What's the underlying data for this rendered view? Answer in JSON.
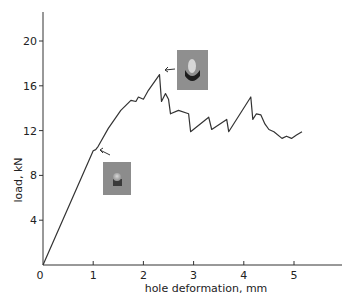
{
  "chart_data": {
    "type": "line",
    "title": "",
    "xlabel": "hole deformation, mm",
    "ylabel": "load, kN",
    "xlim": [
      0,
      5.5
    ],
    "ylim": [
      0,
      22
    ],
    "x_ticks": [
      "0",
      "1",
      "2",
      "3",
      "4",
      "5"
    ],
    "y_ticks": [
      "4",
      "8",
      "12",
      "16",
      "20"
    ],
    "grid": false,
    "legend": null,
    "series": [
      {
        "name": "load-deformation",
        "x": [
          0,
          1.0,
          1.05,
          1.1,
          1.3,
          1.55,
          1.75,
          1.85,
          1.9,
          2.0,
          2.1,
          2.32,
          2.36,
          2.44,
          2.5,
          2.54,
          2.7,
          2.9,
          2.94,
          3.3,
          3.36,
          3.66,
          3.7,
          4.14,
          4.18,
          4.25,
          4.34,
          4.42,
          4.5,
          4.6,
          4.76,
          4.85,
          4.95,
          5.05,
          5.16
        ],
        "y": [
          0,
          10.2,
          10.3,
          10.6,
          12.2,
          13.8,
          14.7,
          14.6,
          15.0,
          14.8,
          15.6,
          17.0,
          14.6,
          15.3,
          14.8,
          13.5,
          13.8,
          13.5,
          11.9,
          13.2,
          12.1,
          13.0,
          11.9,
          15.0,
          13.0,
          13.5,
          13.4,
          12.6,
          12.1,
          11.9,
          11.3,
          11.5,
          11.3,
          11.6,
          11.9
        ]
      }
    ],
    "annotations": [
      {
        "type": "inset-photo",
        "description": "specimen photo at knee",
        "x": 1.05,
        "y": 10.3
      },
      {
        "type": "inset-photo",
        "description": "specimen photo at peak",
        "x": 2.32,
        "y": 17.0
      }
    ]
  },
  "axes": {
    "x_label": "hole deformation, mm",
    "y_label": "load, kN",
    "x_ticks": [
      "0",
      "1",
      "2",
      "3",
      "4",
      "5"
    ],
    "y_ticks": [
      "4",
      "8",
      "12",
      "16",
      "20"
    ]
  }
}
